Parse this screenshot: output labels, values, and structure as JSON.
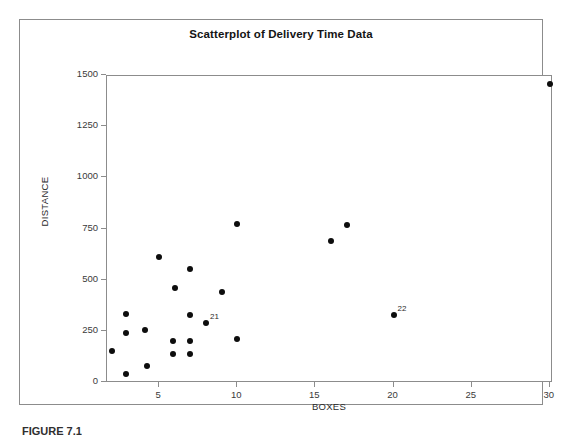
{
  "figure": {
    "caption": "FIGURE 7.1"
  },
  "chart_data": {
    "type": "scatter",
    "title": "Scatterplot of Delivery Time Data",
    "xlabel": "BOXES",
    "ylabel": "DISTANCE",
    "xlim": [
      1.67,
      30.2
    ],
    "ylim": [
      0,
      1500
    ],
    "grid": false,
    "legend": null,
    "xticks": [
      5,
      10,
      15,
      20,
      25,
      30
    ],
    "yticks": [
      0,
      250,
      500,
      750,
      1000,
      1250,
      1500
    ],
    "points": [
      {
        "x": 2.0,
        "y": 156,
        "label": ""
      },
      {
        "x": 2.9,
        "y": 337,
        "label": ""
      },
      {
        "x": 2.9,
        "y": 244,
        "label": ""
      },
      {
        "x": 2.9,
        "y": 44,
        "label": ""
      },
      {
        "x": 4.1,
        "y": 259,
        "label": ""
      },
      {
        "x": 4.2,
        "y": 83,
        "label": ""
      },
      {
        "x": 5.0,
        "y": 615,
        "label": ""
      },
      {
        "x": 6.0,
        "y": 465,
        "label": ""
      },
      {
        "x": 5.9,
        "y": 205,
        "label": ""
      },
      {
        "x": 5.9,
        "y": 142,
        "label": ""
      },
      {
        "x": 7.0,
        "y": 558,
        "label": ""
      },
      {
        "x": 7.0,
        "y": 333,
        "label": ""
      },
      {
        "x": 7.0,
        "y": 205,
        "label": ""
      },
      {
        "x": 7.0,
        "y": 142,
        "label": ""
      },
      {
        "x": 8.0,
        "y": 293,
        "label": "21"
      },
      {
        "x": 9.0,
        "y": 445,
        "label": ""
      },
      {
        "x": 10.0,
        "y": 775,
        "label": ""
      },
      {
        "x": 10.0,
        "y": 215,
        "label": ""
      },
      {
        "x": 16.0,
        "y": 695,
        "label": ""
      },
      {
        "x": 17.0,
        "y": 772,
        "label": ""
      },
      {
        "x": 20.0,
        "y": 333,
        "label": "22"
      },
      {
        "x": 30.0,
        "y": 1460,
        "label": ""
      }
    ]
  }
}
